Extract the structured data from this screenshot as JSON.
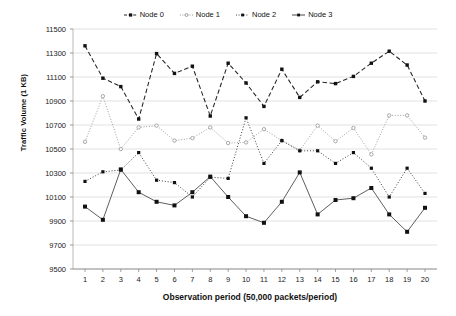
{
  "chart_data": {
    "type": "line",
    "title": "",
    "xlabel": "Observation period (50,000 packets/period)",
    "ylabel": "Traffic Volume (1 KB)",
    "xlim": [
      1,
      20
    ],
    "ylim": [
      9500,
      11500
    ],
    "y_ticks": [
      9500,
      9700,
      9900,
      10100,
      10300,
      10500,
      10700,
      10900,
      11100,
      11300,
      11500
    ],
    "x_ticks": [
      1,
      2,
      3,
      4,
      5,
      6,
      7,
      8,
      9,
      10,
      11,
      12,
      13,
      14,
      15,
      16,
      17,
      18,
      19,
      20
    ],
    "grid": true,
    "grid_axis": "y",
    "legend_position": "top-center",
    "categories": [
      1,
      2,
      3,
      4,
      5,
      6,
      7,
      8,
      9,
      10,
      11,
      12,
      13,
      14,
      15,
      16,
      17,
      18,
      19,
      20
    ],
    "series": [
      {
        "name": "Node 0",
        "line_style": "solid",
        "color": "#555555",
        "marker": "square",
        "values": [
          10020,
          9910,
          10330,
          10140,
          10060,
          10030,
          10140,
          10270,
          10100,
          9940,
          9885,
          10060,
          10305,
          9955,
          10075,
          10090,
          10175,
          9955,
          9810,
          10010
        ]
      },
      {
        "name": "Node 1",
        "line_style": "dotted",
        "color": "#9a9a9a",
        "marker": "circle",
        "values": [
          10560,
          10940,
          10500,
          10680,
          10695,
          10570,
          10590,
          10680,
          10550,
          10555,
          10665,
          10570,
          10490,
          10695,
          10565,
          10675,
          10455,
          10780,
          10780,
          10595
        ]
      },
      {
        "name": "Node 2",
        "line_style": "dotted-dark",
        "color": "#333333",
        "marker": "square",
        "values": [
          10230,
          10310,
          10325,
          10470,
          10240,
          10220,
          10100,
          10265,
          10255,
          10760,
          10380,
          10570,
          10485,
          10485,
          10380,
          10470,
          10340,
          10100,
          10340,
          10130
        ]
      },
      {
        "name": "Node 3",
        "line_style": "dashed",
        "color": "#222222",
        "marker": "triangle",
        "values": [
          11360,
          11090,
          11020,
          10750,
          11295,
          11130,
          11190,
          10775,
          11215,
          11050,
          10855,
          11165,
          10930,
          11060,
          11045,
          11105,
          11215,
          11315,
          11200,
          10900
        ]
      }
    ]
  },
  "legend": {
    "items": [
      {
        "label": "Node 0"
      },
      {
        "label": "Node 1"
      },
      {
        "label": "Node 2"
      },
      {
        "label": "Node 3"
      }
    ]
  }
}
